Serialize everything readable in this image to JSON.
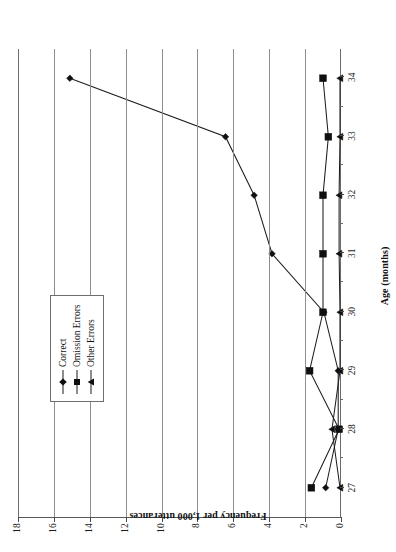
{
  "chart_data": {
    "type": "line",
    "title": "",
    "xlabel": "Age (months)",
    "ylabel": "Frequency per 1,000 utterances",
    "categories": [
      27,
      28,
      29,
      30,
      31,
      32,
      33,
      34
    ],
    "xtick_labels": [
      "27",
      "28",
      "29",
      "30",
      "31",
      "32",
      "33",
      "34"
    ],
    "ytick_labels": [
      "0",
      "2",
      "4",
      "6",
      "8",
      "10",
      "12",
      "14",
      "16",
      "18"
    ],
    "ylim": [
      0,
      18
    ],
    "ytick_step": 2,
    "grid": "horizontal",
    "legend_position": "upper-left-inside",
    "series": [
      {
        "name": "Correct",
        "marker": "diamond",
        "values": [
          0.8,
          0.1,
          0.1,
          0.9,
          3.8,
          4.8,
          6.4,
          15.1
        ]
      },
      {
        "name": "Omission Errors",
        "marker": "square",
        "values": [
          1.6,
          0.05,
          1.7,
          0.95,
          0.95,
          0.95,
          0.65,
          0.95
        ]
      },
      {
        "name": "Other Errors",
        "marker": "triangle",
        "values": [
          0.0,
          0.45,
          0.0,
          0.0,
          0.05,
          0.05,
          0.0,
          0.0
        ]
      }
    ],
    "colors": {
      "series_line": "#1d1d1d",
      "marker": "#101010",
      "gridline": "#8e8e8e",
      "axis": "#5a5a5a",
      "background": "#ffffff"
    }
  },
  "legend": {
    "items": [
      {
        "label": "Correct",
        "marker": "diamond"
      },
      {
        "label": "Omission Errors",
        "marker": "square"
      },
      {
        "label": "Other Errors",
        "marker": "triangle"
      }
    ]
  }
}
